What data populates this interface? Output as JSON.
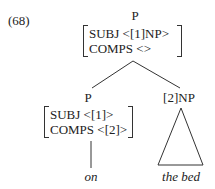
{
  "example_number": "(68)",
  "root": {
    "category": "P",
    "avm": [
      "SUBJ <[1]NP>",
      "COMPS <>"
    ]
  },
  "left_daughter": {
    "category": "P",
    "avm": [
      "SUBJ <[1]>",
      "COMPS <[2]>"
    ],
    "word": "on"
  },
  "right_daughter": {
    "category": "[2]NP",
    "word": "the bed"
  }
}
